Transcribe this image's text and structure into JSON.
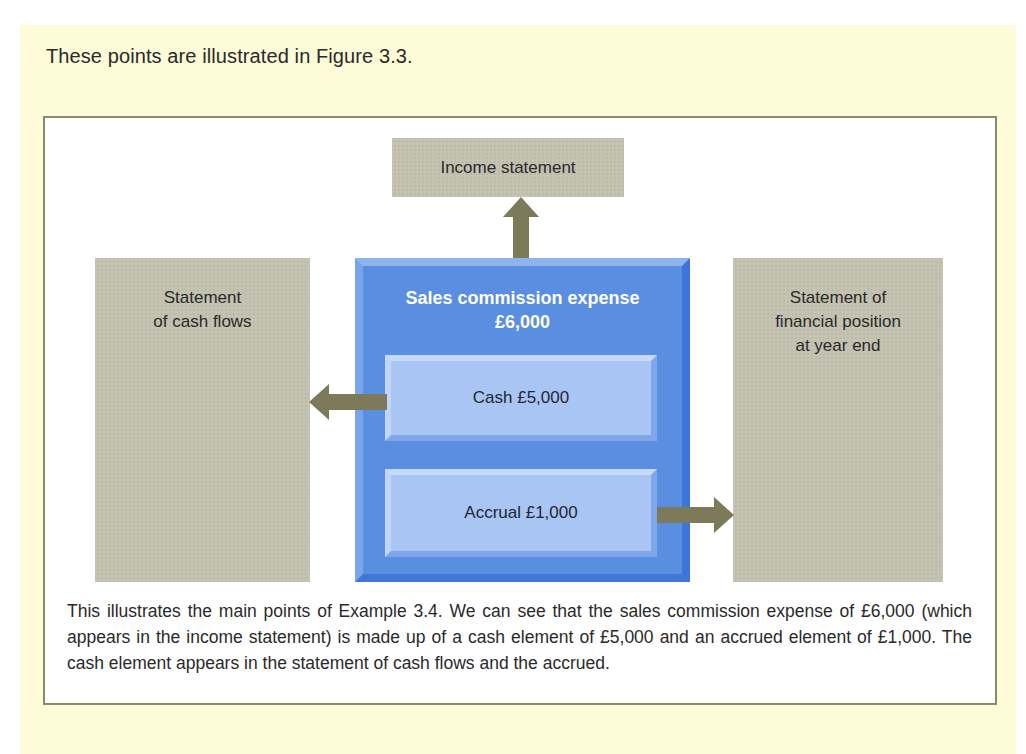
{
  "intro_text": "These points are illustrated in Figure 3.3.",
  "figure": {
    "income_statement": "Income statement",
    "cash_flows": {
      "line1": "Statement",
      "line2": "of cash flows"
    },
    "financial_position": {
      "line1": "Statement of",
      "line2": "financial position",
      "line3": "at year end"
    },
    "expense": {
      "title_line1": "Sales commission expense",
      "title_line2": "£6,000",
      "cash": "Cash £5,000",
      "accrual": "Accrual £1,000"
    },
    "arrows": [
      {
        "from": "Sales commission expense",
        "to": "Income statement",
        "direction": "up"
      },
      {
        "from": "Cash £5,000",
        "to": "Statement of cash flows",
        "direction": "left"
      },
      {
        "from": "Accrual £1,000",
        "to": "Statement of financial position at year end",
        "direction": "right"
      }
    ],
    "caption": "This illustrates the main points of Example 3.4. We can see that the sales commission expense of £6,000 (which appears in the income statement) is made up of a cash element of £5,000 and an accrued element of £1,000. The cash element appears in the statement of cash flows and the accrued."
  },
  "colors": {
    "panel_background": "#fdfbd8",
    "gray_box": "#c4c2b0",
    "blue_box": "#5a8ee0",
    "inner_box": "#a9c5f4",
    "arrow": "#7d7a5a",
    "frame_border": "#8a8a6e"
  }
}
